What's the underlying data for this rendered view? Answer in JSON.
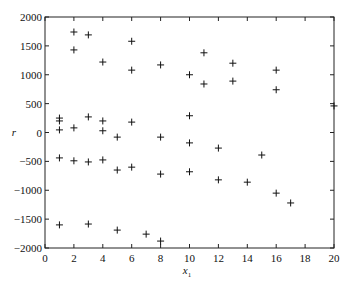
{
  "chart_data": {
    "type": "scatter",
    "title": "",
    "xlabel": "x1",
    "xlabel_main": "x",
    "xlabel_sub": "1",
    "ylabel": "r",
    "xlim": [
      0,
      20
    ],
    "ylim": [
      -2000,
      2000
    ],
    "xticks": [
      0,
      2,
      4,
      6,
      8,
      10,
      12,
      14,
      16,
      18,
      20
    ],
    "yticks": [
      2000,
      1500,
      1000,
      500,
      0,
      -500,
      -1000,
      -1500,
      -2000
    ],
    "xtick_labels": [
      "0",
      "2",
      "4",
      "6",
      "8",
      "10",
      "12",
      "14",
      "16",
      "18",
      "20"
    ],
    "ytick_labels": [
      "2000",
      "1500",
      "1000",
      "500",
      "0",
      "−500",
      "−1000",
      "−1500",
      "−2000"
    ],
    "grid": false,
    "legend": null,
    "marker": "+",
    "marker_color": "#111111",
    "series": [
      {
        "name": "residuals",
        "points": [
          [
            1,
            250
          ],
          [
            1,
            200
          ],
          [
            1,
            45
          ],
          [
            1,
            -440
          ],
          [
            1,
            -1600
          ],
          [
            2,
            1740
          ],
          [
            2,
            1430
          ],
          [
            2,
            80
          ],
          [
            2,
            -490
          ],
          [
            3,
            1690
          ],
          [
            3,
            270
          ],
          [
            3,
            -510
          ],
          [
            3,
            -1585
          ],
          [
            4,
            1220
          ],
          [
            4,
            200
          ],
          [
            4,
            30
          ],
          [
            4,
            -475
          ],
          [
            5,
            -80
          ],
          [
            5,
            -650
          ],
          [
            5,
            -1690
          ],
          [
            6,
            1580
          ],
          [
            6,
            1080
          ],
          [
            6,
            180
          ],
          [
            6,
            -600
          ],
          [
            7,
            -1760
          ],
          [
            8,
            1170
          ],
          [
            8,
            -80
          ],
          [
            8,
            -720
          ],
          [
            8,
            -1880
          ],
          [
            10,
            1000
          ],
          [
            10,
            290
          ],
          [
            10,
            -180
          ],
          [
            10,
            -680
          ],
          [
            11,
            1380
          ],
          [
            11,
            840
          ],
          [
            12,
            -270
          ],
          [
            12,
            -820
          ],
          [
            13,
            1200
          ],
          [
            13,
            890
          ],
          [
            14,
            -860
          ],
          [
            15,
            -390
          ],
          [
            16,
            1080
          ],
          [
            16,
            740
          ],
          [
            16,
            -1050
          ],
          [
            17,
            -1220
          ],
          [
            20,
            460
          ]
        ]
      }
    ]
  }
}
